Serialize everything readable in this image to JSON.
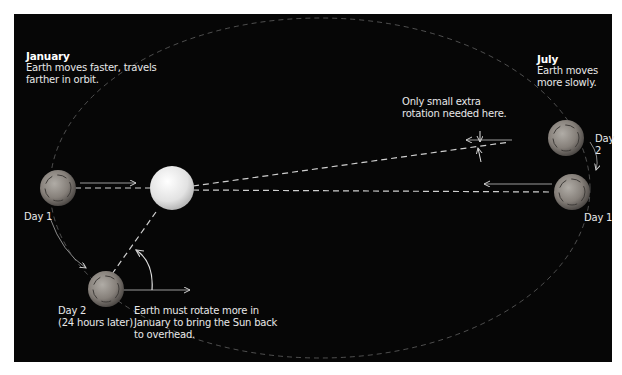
{
  "diagram": {
    "background_color": "#060606",
    "text_color": "#e8e8e8",
    "sun": {
      "label": "Sun",
      "color": "#e6e6e6"
    },
    "january": {
      "heading": "January",
      "description_line1": "Earth moves faster, travels",
      "description_line2": "farther in orbit.",
      "day1_label": "Day 1",
      "day2_label_line1": "Day 2",
      "day2_label_line2": "(24 hours later)",
      "rotation_note_line1": "Earth must rotate more in",
      "rotation_note_line2": "January to bring the Sun back",
      "rotation_note_line3": "to overhead."
    },
    "july": {
      "heading": "July",
      "description_line1": "Earth moves",
      "description_line2": "more slowly.",
      "day1_label": "Day 1",
      "day2_label": "Day 2",
      "rotation_note_line1": "Only small extra",
      "rotation_note_line2": "rotation needed here."
    },
    "icons": [
      "earth-globe-icon",
      "sun-sphere-icon",
      "direction-arrow-icon",
      "rotation-arc-icon"
    ]
  }
}
